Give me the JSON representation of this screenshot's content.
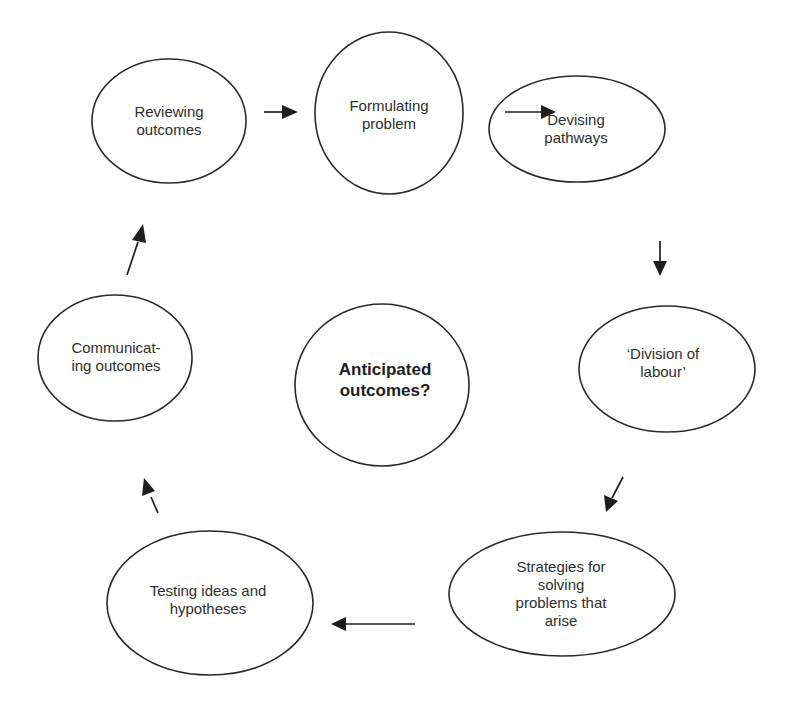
{
  "diagram": {
    "type": "cycle",
    "stroke_color": "#2a2a2a",
    "background": "#ffffff",
    "center": {
      "id": "anticipated",
      "label": "Anticipated\noutcomes?",
      "bold": true
    },
    "nodes": [
      {
        "id": "reviewing",
        "label": "Reviewing\noutcomes"
      },
      {
        "id": "formulating",
        "label": "Formulating\nproblem"
      },
      {
        "id": "devising",
        "label": "Devising\npathways"
      },
      {
        "id": "division",
        "label": "‘Division of\nlabour’"
      },
      {
        "id": "strategies",
        "label": "Strategies for\nsolving\nproblems that\narise"
      },
      {
        "id": "testing",
        "label": "Testing ideas and\nhypotheses"
      },
      {
        "id": "communicating",
        "label": "Communicat-\ning outcomes"
      }
    ],
    "edges": [
      {
        "from": "reviewing",
        "to": "formulating"
      },
      {
        "from": "formulating",
        "to": "devising"
      },
      {
        "from": "devising",
        "to": "division"
      },
      {
        "from": "division",
        "to": "strategies"
      },
      {
        "from": "strategies",
        "to": "testing"
      },
      {
        "from": "testing",
        "to": "communicating"
      },
      {
        "from": "communicating",
        "to": "reviewing"
      }
    ]
  }
}
